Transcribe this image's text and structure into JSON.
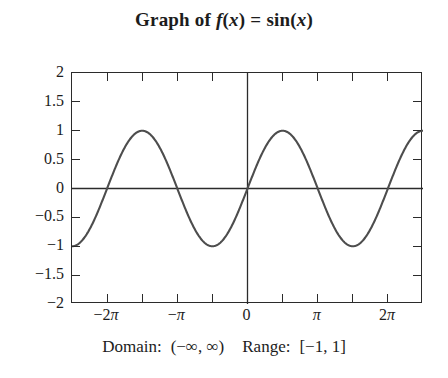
{
  "chart_data": {
    "type": "line",
    "title_parts": {
      "prefix": "Graph of",
      "function": "f",
      "arg_open": "(",
      "variable": "x",
      "arg_close": ")",
      "equals": "=",
      "expression": "sin",
      "expr_arg_open": "(",
      "expr_variable": "x",
      "expr_arg_close": ")"
    },
    "function_expression": "sin(x)",
    "xlabel": "",
    "ylabel": "",
    "xlim": [
      -7.853981634,
      7.853981634
    ],
    "ylim": [
      -2,
      2
    ],
    "xlim_label": [
      "-2.5π",
      "2.5π"
    ],
    "grid": false,
    "legend": "none",
    "axes_drawn": [
      "x-axis at y=0",
      "y-axis at x=0"
    ],
    "line_color": "#4d4d4d",
    "line_width": 2.1,
    "frame_color": "#2b2b2b",
    "background": "#ffffff",
    "x_ticks": {
      "values": [
        -7.853981634,
        -6.283185307,
        -4.71238898,
        -3.141592654,
        -1.570796327,
        0,
        1.570796327,
        3.141592654,
        4.71238898,
        6.283185307,
        7.853981634
      ],
      "labeled_values": [
        -6.283185307,
        -3.141592654,
        0,
        3.141592654,
        6.283185307
      ],
      "labels": [
        "−2π",
        "−π",
        "0",
        "π",
        "2π"
      ],
      "label_parts": [
        {
          "sign": "−",
          "coef": "2",
          "pi": "π"
        },
        {
          "sign": "−",
          "coef": "",
          "pi": "π"
        },
        {
          "sign": "",
          "coef": "0",
          "pi": ""
        },
        {
          "sign": "",
          "coef": "",
          "pi": "π"
        },
        {
          "sign": "",
          "coef": "2",
          "pi": "π"
        }
      ]
    },
    "y_ticks": {
      "values": [
        2,
        1.5,
        1,
        0.5,
        0,
        -0.5,
        -1,
        -1.5,
        -2
      ],
      "labels": [
        "2",
        "1.5",
        "1",
        "0.5",
        "0",
        "−0.5",
        "−1",
        "−1.5",
        "−2"
      ]
    },
    "key_points": [
      {
        "x": -7.853981634,
        "y": -1,
        "note": "left frame edge, minimum"
      },
      {
        "x": -6.283185307,
        "y": 0,
        "note": "x = -2π, zero crossing"
      },
      {
        "x": -4.71238898,
        "y": 1,
        "note": "maximum"
      },
      {
        "x": -3.141592654,
        "y": 0,
        "note": "x = -π, zero crossing"
      },
      {
        "x": -1.570796327,
        "y": -1,
        "note": "minimum"
      },
      {
        "x": 0,
        "y": 0,
        "note": "origin, zero crossing"
      },
      {
        "x": 1.570796327,
        "y": 1,
        "note": "maximum"
      },
      {
        "x": 3.141592654,
        "y": 0,
        "note": "x = π, zero crossing"
      },
      {
        "x": 4.71238898,
        "y": -1,
        "note": "minimum"
      },
      {
        "x": 6.283185307,
        "y": 0,
        "note": "x = 2π, zero crossing"
      },
      {
        "x": 7.853981634,
        "y": 1,
        "note": "right frame edge, maximum"
      }
    ],
    "amplitude": 1,
    "period": 6.283185307,
    "period_label": "2π"
  },
  "caption": {
    "domain_label": "Domain:",
    "domain_value": "(−∞, ∞)",
    "range_label": "Range:",
    "range_value": "[−1, 1]",
    "full_text": "Domain: (−∞, ∞)  Range: [−1, 1]"
  }
}
